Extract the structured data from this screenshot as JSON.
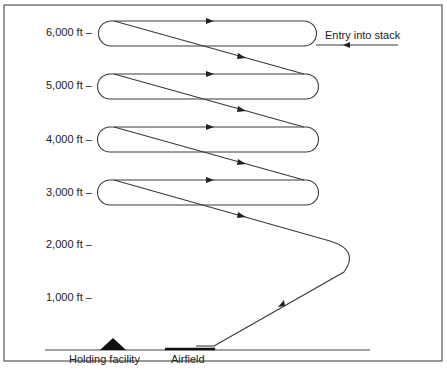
{
  "diagram": {
    "altitude_labels": [
      "6,000 ft –",
      "5,000 ft –",
      "4,000 ft –",
      "3,000 ft –",
      "2,000 ft –",
      "1,000 ft –"
    ],
    "entry_label": "Entry into stack",
    "ground_labels": {
      "holding_facility": "Holding facility",
      "airfield": "Airfield"
    },
    "colors": {
      "line": "#3a3a3a",
      "frame": "#555555",
      "background": "#ffffff"
    }
  }
}
